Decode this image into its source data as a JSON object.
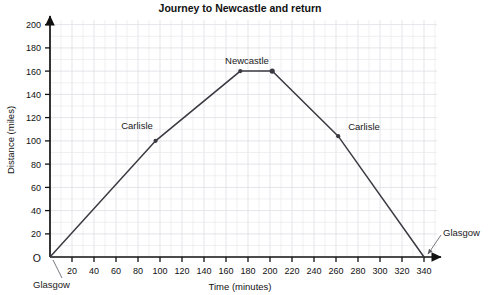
{
  "chart_data": {
    "type": "line",
    "title": "Journey to Newcastle and return",
    "xlabel": "Time (minutes)",
    "ylabel": "Distance (miles)",
    "xlim": [
      0,
      340
    ],
    "ylim": [
      0,
      200
    ],
    "grid": true,
    "legend": "none",
    "x_ticks": [
      0,
      20,
      40,
      60,
      80,
      100,
      120,
      140,
      160,
      180,
      200,
      220,
      240,
      260,
      280,
      300,
      320,
      340
    ],
    "x_tick_labels": [
      "O",
      "20",
      "40",
      "60",
      "80",
      "100",
      "120",
      "140",
      "160",
      "180",
      "200",
      "220",
      "240",
      "260",
      "280",
      "300",
      "320",
      "340"
    ],
    "y_ticks": [
      0,
      20,
      40,
      60,
      80,
      100,
      120,
      140,
      160,
      180,
      200
    ],
    "y_tick_labels": [
      "O",
      "20",
      "40",
      "60",
      "80",
      "100",
      "120",
      "140",
      "160",
      "180",
      "200"
    ],
    "x_minor_step": 10,
    "y_minor_step": 10,
    "series": [
      {
        "name": "Journey",
        "points": [
          {
            "x": 0,
            "y": 0
          },
          {
            "x": 96,
            "y": 100
          },
          {
            "x": 173,
            "y": 160
          },
          {
            "x": 202,
            "y": 160
          },
          {
            "x": 262,
            "y": 104
          },
          {
            "x": 340,
            "y": 0
          }
        ],
        "markers_at": [
          {
            "x": 96,
            "y": 100
          },
          {
            "x": 173,
            "y": 160
          },
          {
            "x": 202,
            "y": 160
          },
          {
            "x": 262,
            "y": 104
          }
        ]
      }
    ],
    "annotations": [
      {
        "name": "origin-glasgow",
        "label": "Glasgow",
        "x": 0,
        "y": 0
      },
      {
        "name": "carlisle-outbound",
        "label": "Carlisle",
        "x": 96,
        "y": 100
      },
      {
        "name": "newcastle-peak",
        "label": "Newcastle",
        "x": 180,
        "y": 160
      },
      {
        "name": "carlisle-return",
        "label": "Carlisle",
        "x": 262,
        "y": 104
      },
      {
        "name": "end-glasgow",
        "label": "Glasgow",
        "x": 340,
        "y": 0
      }
    ]
  },
  "labels": {
    "title": "Journey to Newcastle and return",
    "x_axis_title": "Time (minutes)",
    "y_axis_title": "Distance (miles)",
    "origin": "O",
    "origin_x": "O",
    "glasgow_start": "Glasgow",
    "glasgow_end": "Glasgow",
    "carlisle_out": "Carlisle",
    "carlisle_back": "Carlisle",
    "newcastle": "Newcastle",
    "y": {
      "t20": "20",
      "t40": "40",
      "t60": "60",
      "t80": "80",
      "t100": "100",
      "t120": "120",
      "t140": "140",
      "t160": "160",
      "t180": "180",
      "t200": "200"
    },
    "x": {
      "t20": "20",
      "t40": "40",
      "t60": "60",
      "t80": "80",
      "t100": "100",
      "t120": "120",
      "t140": "140",
      "t160": "160",
      "t180": "180",
      "t200": "200",
      "t220": "220",
      "t240": "240",
      "t260": "260",
      "t280": "280",
      "t300": "300",
      "t320": "320",
      "t340": "340"
    }
  },
  "colors": {
    "line": "#3a3a42",
    "axis": "#111111",
    "grid_minor": "#e9e9ee",
    "grid_major": "#dedee4",
    "background": "#ffffff",
    "text": "#111111"
  }
}
